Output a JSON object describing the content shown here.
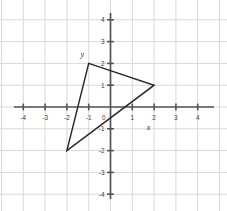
{
  "figure": {
    "title": "",
    "background_color": "#ffffff",
    "width": 227,
    "height": 211
  },
  "axes": {
    "x_name": "x",
    "y_name": "y",
    "x_name_position": {
      "x": 1.75,
      "y": -1.05
    },
    "y_name_position": {
      "x": -1.3,
      "y": 2.28
    },
    "grid": true,
    "grid_color": "#d8d8dc",
    "axis_color": "#555558",
    "xlim": [
      -4.6,
      5.0
    ],
    "ylim": [
      -4.4,
      4.4
    ],
    "x_ticks": [
      -4,
      -3,
      -2,
      -1,
      1,
      2,
      3,
      4
    ],
    "x_tick_labels": [
      "-4",
      "-3",
      "-2",
      "-1",
      "1",
      "2",
      "3",
      "4"
    ],
    "y_ticks": [
      4,
      3,
      2,
      1,
      -1,
      -2,
      -3,
      -4
    ],
    "y_tick_labels": [
      "4",
      "3",
      "2",
      "1",
      "-1",
      "-2",
      "-3",
      "-4"
    ],
    "origin_label": "0"
  },
  "chart_data": {
    "type": "scatter",
    "title": "",
    "xlabel": "x",
    "ylabel": "y",
    "xlim": [
      -4.6,
      5.0
    ],
    "ylim": [
      -4.4,
      4.4
    ],
    "grid": true,
    "legend": null,
    "series": [
      {
        "name": "triangle",
        "kind": "polygon",
        "closed": true,
        "stroke": "#2b2b2b",
        "fill": "none",
        "points": [
          {
            "x": -1,
            "y": 2
          },
          {
            "x": 2,
            "y": 1
          },
          {
            "x": -2,
            "y": -2
          }
        ]
      }
    ],
    "vertex_labels": [
      "(-1, 2)",
      "(2, 1)",
      "(-2, -2)"
    ]
  }
}
